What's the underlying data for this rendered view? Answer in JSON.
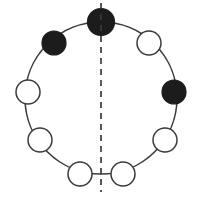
{
  "figure": {
    "title": "Necklace diagram with reflection axis",
    "canvas": {
      "width": 199,
      "height": 200,
      "background": "#ffffff"
    },
    "ring": {
      "center_x": 101,
      "center_y": 98,
      "radius": 76,
      "stroke_color": "#3a3a3a",
      "stroke_width": 1.6
    },
    "colors": {
      "filled_bead": "#1c1c1c",
      "open_bead": "#ffffff",
      "outline": "#3a3a3a",
      "axis": "#3a3a3a",
      "background": "#ffffff"
    },
    "counts": {
      "total_beads": 10,
      "filled_beads": 3,
      "open_beads": 7
    },
    "axis": {
      "label": "vertical-mirror-axis",
      "x": 101,
      "y_top": 3,
      "y_bottom": 192,
      "style": "dashed",
      "dash_pattern": "6 5"
    },
    "beads": [
      {
        "id": "bead-1",
        "label": "top",
        "angle_deg": 90,
        "cx": 101,
        "cy": 22,
        "r": 13.5,
        "state": "filled"
      },
      {
        "id": "bead-2",
        "label": "upper-right",
        "angle_deg": 54,
        "cx": 149,
        "cy": 43,
        "r": 12,
        "state": "open"
      },
      {
        "id": "bead-3",
        "label": "right-upper",
        "angle_deg": 18,
        "cx": 174,
        "cy": 92,
        "r": 12,
        "state": "filled"
      },
      {
        "id": "bead-4",
        "label": "right-lower",
        "angle_deg": -18,
        "cx": 165,
        "cy": 140,
        "r": 12,
        "state": "open"
      },
      {
        "id": "bead-5",
        "label": "bottom-right",
        "angle_deg": -54,
        "cx": 123,
        "cy": 174,
        "r": 12,
        "state": "open"
      },
      {
        "id": "bead-6",
        "label": "bottom-left",
        "angle_deg": -126,
        "cx": 80,
        "cy": 174,
        "r": 12,
        "state": "open"
      },
      {
        "id": "bead-7",
        "label": "left-lower",
        "angle_deg": -162,
        "cx": 40,
        "cy": 140,
        "r": 12,
        "state": "open"
      },
      {
        "id": "bead-8",
        "label": "left-upper",
        "angle_deg": 162,
        "cx": 28,
        "cy": 92,
        "r": 12,
        "state": "open"
      },
      {
        "id": "bead-9",
        "label": "upper-left",
        "angle_deg": 126,
        "cx": 54,
        "cy": 43,
        "r": 12,
        "state": "filled"
      }
    ]
  }
}
